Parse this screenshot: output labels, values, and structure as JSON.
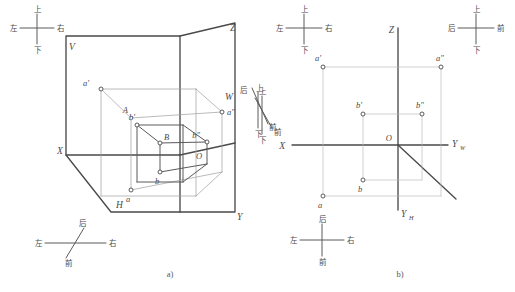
{
  "figure": {
    "captions": {
      "panel_a": "a)",
      "panel_b": "b)"
    }
  },
  "glyphs": {
    "up": "上",
    "down": "下",
    "left": "左",
    "right": "右",
    "front": "前",
    "back": "后"
  },
  "panel_a": {
    "plane_labels": {
      "v_plane": "V",
      "h_plane": "H",
      "w_plane": "W"
    },
    "axis_labels": {
      "x": "X",
      "y": "Y",
      "z": "Z"
    },
    "point_labels": {
      "origin": "O",
      "A_space": "A",
      "B_space": "B",
      "a_front": "a'",
      "a_top": "a",
      "a_side": "a\"",
      "b_front": "b'",
      "b_top": "b",
      "b_side": "b\""
    },
    "compass_top_left": {
      "name": "up-down-left-right-compass",
      "top": "上",
      "bottom": "下",
      "left": "左",
      "right": "右"
    },
    "compass_bottom_left": {
      "name": "back-front-left-right-compass",
      "top": "后",
      "bottom": "前",
      "left": "左",
      "right": "右"
    },
    "compass_right": {
      "name": "up-down-back-front-compass",
      "top": "上",
      "bottom": "下",
      "back": "后",
      "front": "前"
    }
  },
  "panel_b": {
    "axis_labels": {
      "x": "X",
      "z": "Z",
      "y_w": "Y",
      "y_w_sub": "W",
      "y_h": "Y",
      "y_h_sub": "H"
    },
    "point_labels": {
      "origin": "O",
      "a_front": "a'",
      "a_top": "a",
      "a_side": "a\"",
      "b_front": "b'",
      "b_top": "b",
      "b_side": "b\""
    },
    "compass_top_left": {
      "name": "up-down-left-right-compass",
      "top": "上",
      "bottom": "下",
      "left": "左",
      "right": "右"
    },
    "compass_top_right": {
      "name": "up-down-back-front-compass",
      "top": "上",
      "bottom": "下",
      "left": "后",
      "right": "前"
    },
    "compass_left_edge": {
      "name": "up-down-front-compass",
      "top": "上",
      "bottom": "下",
      "front": "前"
    },
    "compass_bottom": {
      "name": "back-front-left-right-compass",
      "top": "后",
      "bottom": "前",
      "left": "左",
      "right": "右"
    }
  }
}
